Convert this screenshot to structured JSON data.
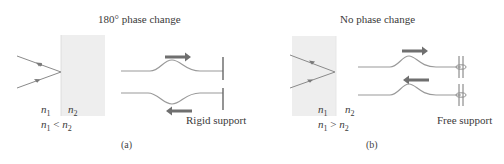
{
  "panels": [
    {
      "id": "a",
      "title": "180° phase change",
      "caption": "(a)",
      "n1": "n",
      "n1_sub": "1",
      "n2": "n",
      "n2_sub": "2",
      "relation_left": "n",
      "relation_left_sub": "1",
      "relation_op": "<",
      "relation_right": "n",
      "relation_right_sub": "2",
      "support_label": "Rigid support",
      "slab_side": "right",
      "pulse_reflected": "inverted"
    },
    {
      "id": "b",
      "title": "No phase change",
      "caption": "(b)",
      "n1": "n",
      "n1_sub": "1",
      "n2": "n",
      "n2_sub": "2",
      "relation_left": "n",
      "relation_left_sub": "1",
      "relation_op": ">",
      "relation_right": "n",
      "relation_right_sub": "2",
      "support_label": "Free support",
      "slab_side": "left",
      "pulse_reflected": "upright"
    }
  ],
  "colors": {
    "slab": "#eeeeee",
    "ray": "#8a8a8a",
    "string": "#9a9a9a",
    "arrow": "#6f6f6f",
    "support": "#666666",
    "text": "#3a3a3a"
  }
}
